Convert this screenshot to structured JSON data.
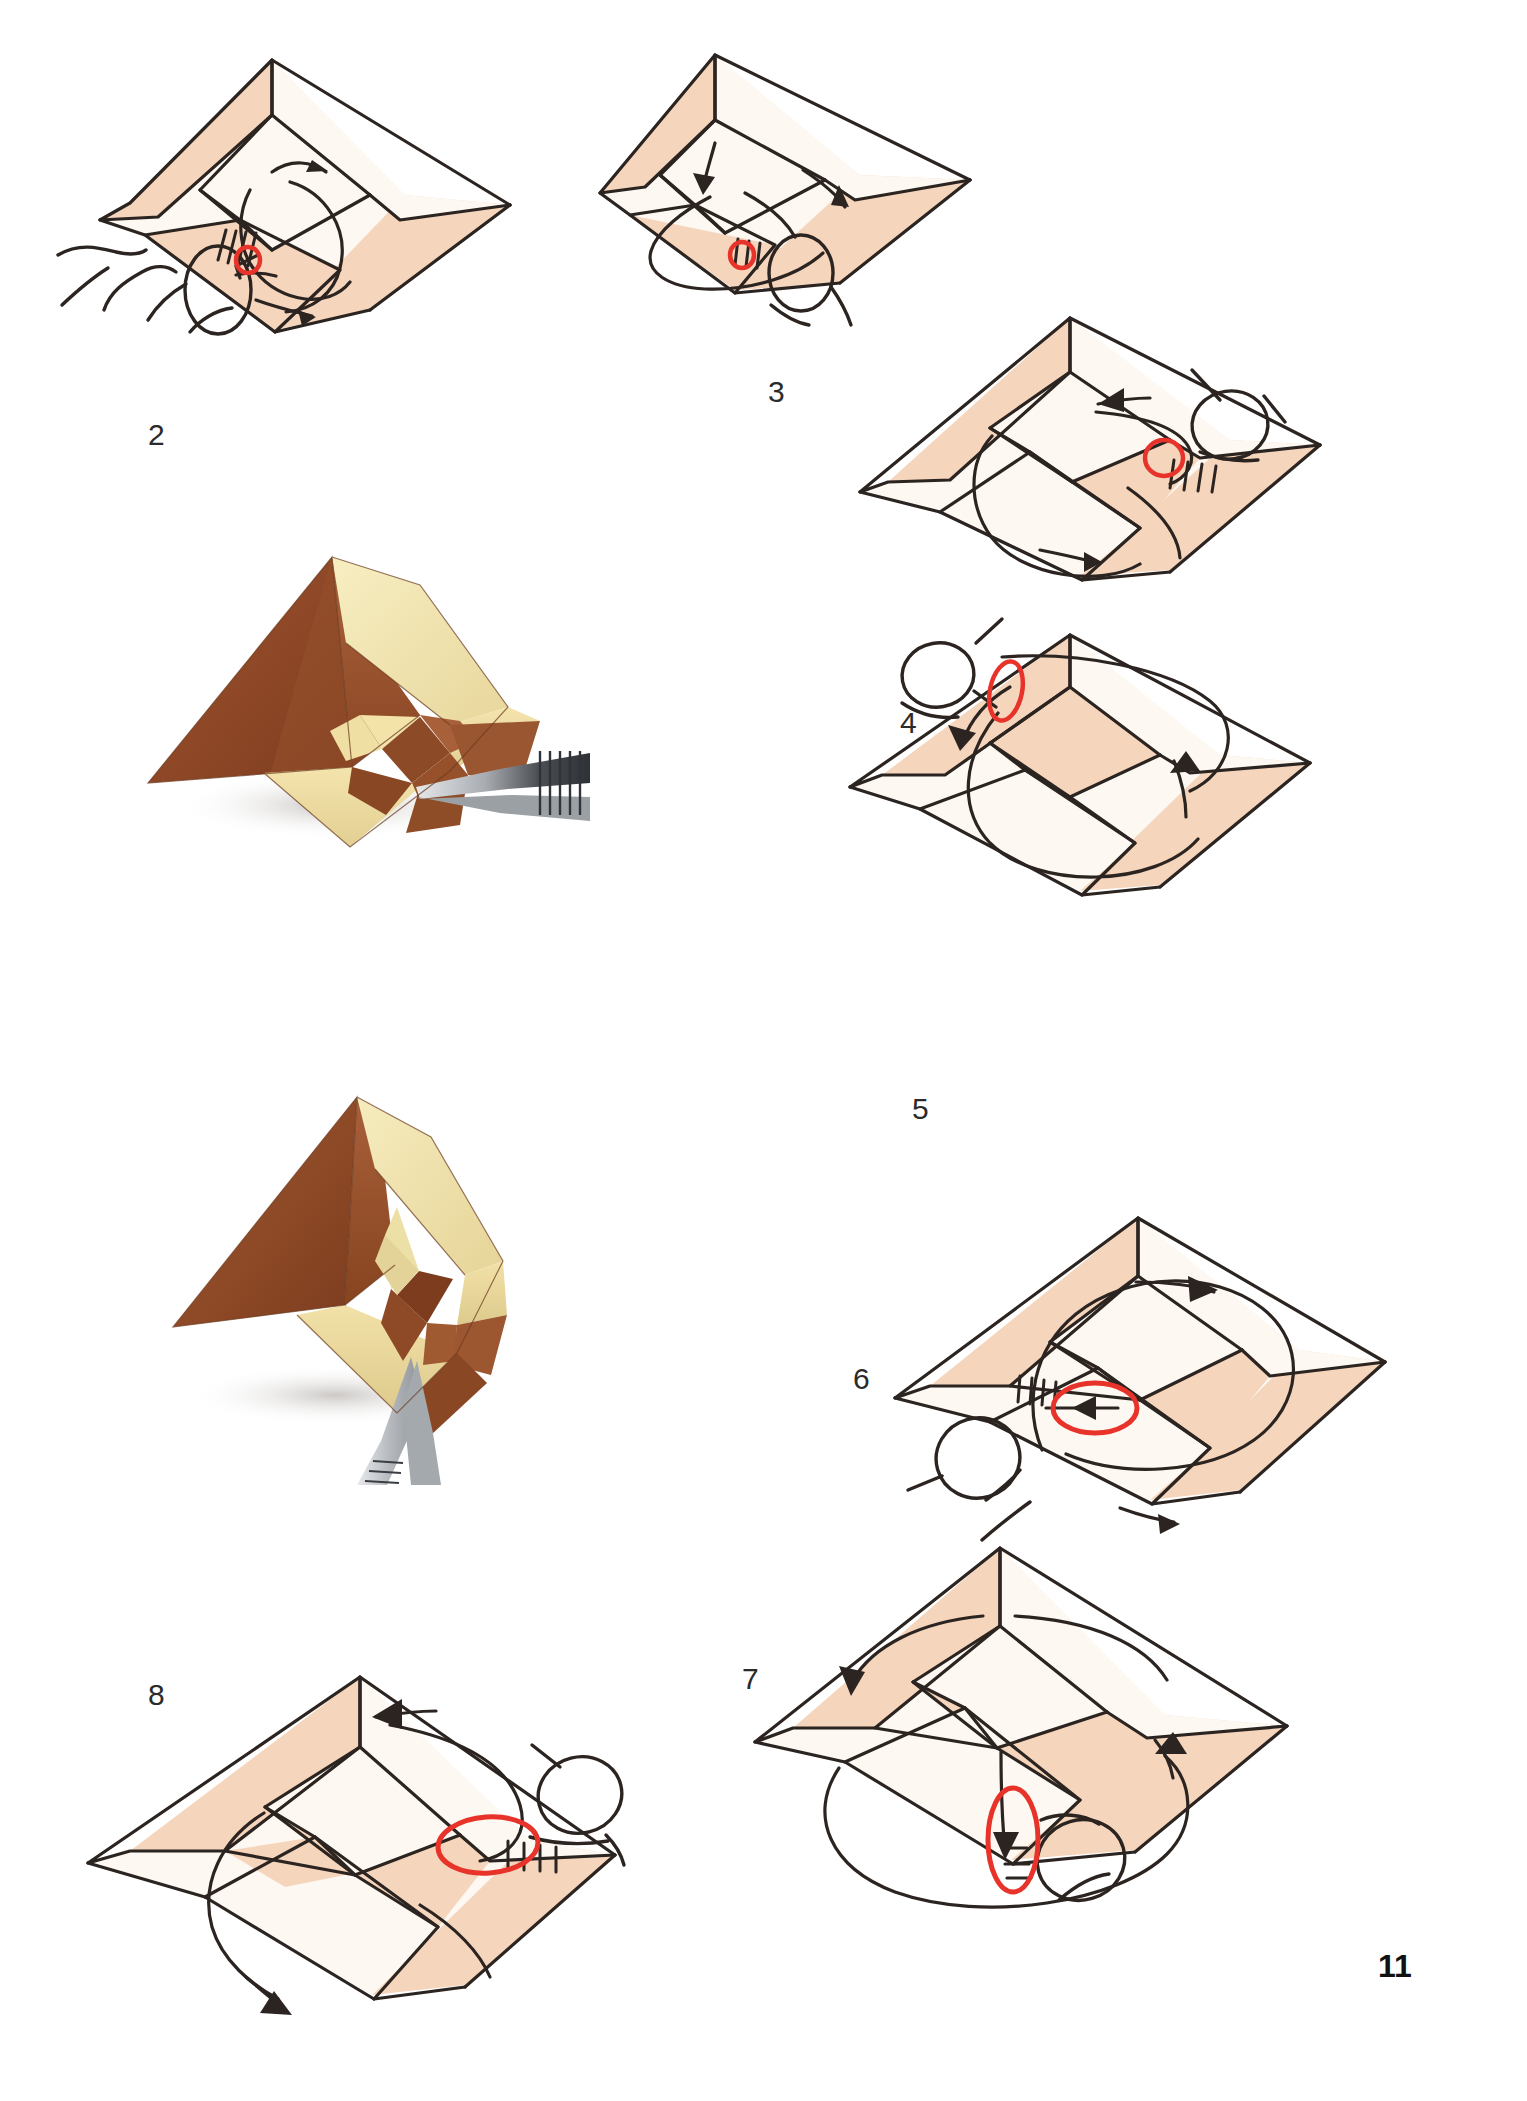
{
  "page": {
    "page_number": "11",
    "background_color": "#ffffff",
    "kind": "origami-instruction-page"
  },
  "palette": {
    "paper_front": "#f6d5bd",
    "paper_back": "#fdf8f2",
    "ink": "#2b2420",
    "highlight_circle": "#e8332a",
    "photo_wood_dark": "#8e4b2a",
    "photo_wood_mid": "#a7603a",
    "photo_wood_light": "#f0dfa8",
    "photo_cream": "#f5e6b4",
    "tool_steel": "#b9bcc0",
    "shadow": "#d8d4d0"
  },
  "steps": [
    {
      "id": "step-2",
      "label": "2",
      "label_pos": {
        "x": 148,
        "y": 418
      },
      "diagram_pos": {
        "x": 40,
        "y": 30,
        "w": 470,
        "h": 310
      },
      "hand": "left-hand-thumb-and-finger",
      "highlight": "small-red-circle",
      "arrows": [
        "curved-arrow-upper-left",
        "curved-arrow-lower-right",
        "large-loop-arrow"
      ]
    },
    {
      "id": "step-3",
      "label": "3",
      "label_pos": {
        "x": 768,
        "y": 375
      },
      "diagram_pos": {
        "x": 590,
        "y": 20,
        "w": 430,
        "h": 300
      },
      "hand": "right-hand-thumb",
      "highlight": "small-red-circle",
      "arrows": [
        "curved-arrow-down-left",
        "curved-arrow-up-right",
        "large-loop-arrow"
      ]
    },
    {
      "id": "step-4",
      "label": "4",
      "label_pos": {
        "x": 900,
        "y": 706
      },
      "diagram_pos": {
        "x": 840,
        "y": 300,
        "w": 470,
        "h": 290
      },
      "hand": "right-hand-thumb",
      "highlight": "small-red-circle",
      "arrows": [
        "arrow-left-upper",
        "arrow-right-lower",
        "loop-arrow"
      ]
    },
    {
      "id": "step-5",
      "label": "5",
      "label_pos": {
        "x": 912,
        "y": 1092
      },
      "diagram_pos": {
        "x": 800,
        "y": 600,
        "w": 490,
        "h": 300
      },
      "hand": "left-hand-thumb-upper",
      "highlight": "small-red-circle-vertical",
      "arrows": [
        "arrow-down-left",
        "arrow-up-right",
        "loop-arrow"
      ]
    },
    {
      "id": "step-6",
      "label": "6",
      "label_pos": {
        "x": 853,
        "y": 1362
      },
      "diagram_pos": {
        "x": 860,
        "y": 1200,
        "w": 500,
        "h": 300
      },
      "hand": "left-hand-thumb",
      "highlight": "red-ellipse-horizontal",
      "arrows": [
        "arrow-left-upper",
        "arrow-right-lower",
        "big-circle-arrow"
      ]
    },
    {
      "id": "step-7",
      "label": "7",
      "label_pos": {
        "x": 742,
        "y": 1662
      },
      "diagram_pos": {
        "x": 740,
        "y": 1530,
        "w": 540,
        "h": 330
      },
      "hand": "right-hand-thumb-lower",
      "highlight": "red-ellipse-vertical",
      "arrows": [
        "arrow-down-left",
        "arrow-up-right",
        "big-loop-arrow"
      ]
    },
    {
      "id": "step-8",
      "label": "8",
      "label_pos": {
        "x": 148,
        "y": 1678
      },
      "diagram_pos": {
        "x": 70,
        "y": 1660,
        "w": 520,
        "h": 340
      },
      "hand": "right-hand-thumb",
      "highlight": "red-ellipse-horizontal",
      "arrows": [
        "arrow-left-upper",
        "arrow-down-left-large",
        "loop-arrow"
      ]
    }
  ],
  "photos": [
    {
      "id": "photo-a",
      "caption": "",
      "pos": {
        "x": 130,
        "y": 530,
        "w": 460,
        "h": 330
      },
      "subject": "folded-paper-model-with-tweezers",
      "tool": "tweezers",
      "tool_side": "right"
    },
    {
      "id": "photo-b",
      "caption": "",
      "pos": {
        "x": 140,
        "y": 1070,
        "w": 400,
        "h": 400
      },
      "subject": "folded-paper-model-with-tweezers",
      "tool": "tweezers",
      "tool_side": "bottom"
    }
  ]
}
